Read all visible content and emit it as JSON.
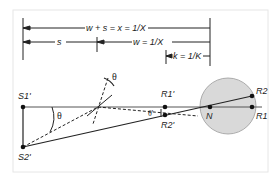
{
  "diagram": {
    "dimensions": {
      "total_label": "w + s = x = 1/X",
      "s_label": "s",
      "w_label": "w = 1/X",
      "k_label": "k = 1/K"
    },
    "points": {
      "s1": "S1'",
      "s2": "S2'",
      "r1_prime": "R1'",
      "r2_prime": "R2'",
      "n": "N",
      "r1": "R1",
      "r2": "R2"
    },
    "angles": {
      "theta": "θ",
      "theta_top": "θ",
      "theta_prime": "θ'"
    },
    "colors": {
      "line": "#222222",
      "eye_fill": "#d9d9d9",
      "frame": "#e6e6e6"
    }
  }
}
